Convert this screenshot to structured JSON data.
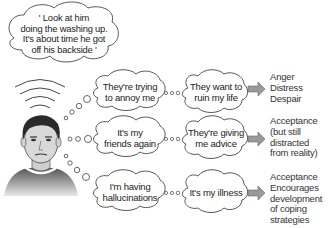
{
  "top_thought": {
    "lines": [
      "' Look at him",
      "doing the washing up.",
      "It's about time he got",
      "off his backside '"
    ]
  },
  "rows": [
    {
      "initial_thought": [
        "They're trying",
        "to annoy me"
      ],
      "interpretation": [
        "They want to",
        "ruin my life"
      ],
      "outcome": [
        "Anger",
        "Distress",
        "Despair"
      ]
    },
    {
      "initial_thought": [
        "It's my",
        "friends again"
      ],
      "interpretation": [
        "They're giving",
        "me advice"
      ],
      "outcome": [
        "Acceptance",
        "(but still",
        "distracted",
        "from reality)"
      ]
    },
    {
      "initial_thought": [
        "I'm having",
        "hallucinations"
      ],
      "interpretation": [
        "It's my illness"
      ],
      "outcome": [
        "Acceptance",
        "Encourages",
        "development",
        "of coping",
        "strategies"
      ]
    }
  ],
  "icons": {
    "person": "man-face-icon",
    "sound_waves": "sound-waves-icon",
    "arrow": "right-arrow-icon"
  },
  "colors": {
    "outline": "#444444",
    "arrow_fill": "#9a9a9a",
    "skin": "#d9d9d9",
    "hair": "#2a2a2a",
    "shirt": "#6a6a6a"
  }
}
